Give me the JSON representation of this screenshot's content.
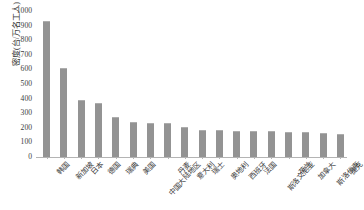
{
  "chart_data": {
    "type": "bar",
    "title": "",
    "subtitle": "",
    "xlabel": "",
    "ylabel": "密度(台/万名工人)",
    "ylim": [
      0,
      1000
    ],
    "ytick_step": 100,
    "grid": false,
    "legend": false,
    "bar_color": "#939393",
    "axis_color": "#b4b4b4",
    "yticks": [
      "1000",
      "900",
      "800",
      "700",
      "600",
      "500",
      "400",
      "300",
      "200",
      "100",
      "0"
    ],
    "categories": [
      "韩国",
      "新加坡",
      "日本",
      "德国",
      "瑞典",
      "美国",
      "中国大陆地区",
      "丹麦",
      "意大利",
      "瑞士",
      "奥地利",
      "西班牙",
      "法国",
      "斯洛文尼亚",
      "荷兰",
      "加拿大",
      "斯洛伐克",
      "捷克"
    ],
    "values": [
      932,
      612,
      390,
      371,
      274,
      240,
      232,
      232,
      205,
      187,
      183,
      180,
      178,
      175,
      173,
      170,
      163,
      155
    ]
  }
}
